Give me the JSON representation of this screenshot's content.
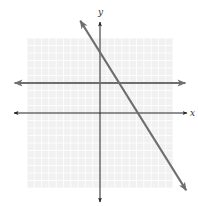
{
  "chart_data": {
    "type": "line",
    "title": "",
    "xlabel": "x",
    "ylabel": "y",
    "xlim": [
      -10,
      10
    ],
    "ylim": [
      -10,
      10
    ],
    "grid": true,
    "tick_labels": false,
    "series": [
      {
        "name": "horizontal line",
        "equation": "y = 4",
        "points": [
          [
            -11.7,
            4
          ],
          [
            11.7,
            4
          ]
        ],
        "color": "#6e6e6e",
        "arrows": "both"
      },
      {
        "name": "decreasing line",
        "equation": "y = -1.6x + 8",
        "x_intercept": 5,
        "y_intercept": 8,
        "points": [
          [
            -2.7,
            12.3
          ],
          [
            11.8,
            -10.3
          ]
        ],
        "color": "#6e6e6e",
        "arrows": "both"
      }
    ],
    "intersection": [
      2.5,
      4
    ]
  },
  "labels": {
    "x_axis": "x",
    "y_axis": "y"
  },
  "colors": {
    "grid_bg": "#f1f1f1",
    "grid_line": "#ffffff",
    "axis": "#222222",
    "line": "#6e6e6e"
  }
}
